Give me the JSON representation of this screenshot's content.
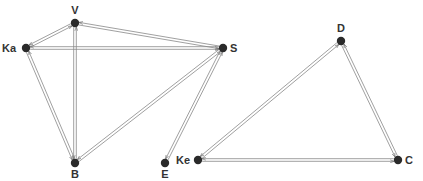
{
  "diagram": {
    "type": "directed-graph",
    "colors": {
      "node": "#2a2a2a",
      "edge": "#888888",
      "label": "#333333",
      "background": "#ffffff"
    },
    "nodes": [
      {
        "id": "V",
        "label": "V",
        "x": 75,
        "y": 23,
        "lx": 75,
        "ly": 14,
        "anchor": "middle"
      },
      {
        "id": "Ka",
        "label": "Ka",
        "x": 26,
        "y": 48,
        "lx": 16,
        "ly": 52,
        "anchor": "end"
      },
      {
        "id": "S",
        "label": "S",
        "x": 223,
        "y": 48,
        "lx": 230,
        "ly": 52,
        "anchor": "start"
      },
      {
        "id": "B",
        "label": "B",
        "x": 75,
        "y": 163,
        "lx": 75,
        "ly": 178,
        "anchor": "middle"
      },
      {
        "id": "E",
        "label": "E",
        "x": 165,
        "y": 163,
        "lx": 165,
        "ly": 178,
        "anchor": "middle"
      },
      {
        "id": "Ke",
        "label": "Ke",
        "x": 198,
        "y": 160,
        "lx": 190,
        "ly": 164,
        "anchor": "end"
      },
      {
        "id": "D",
        "label": "D",
        "x": 341,
        "y": 41,
        "lx": 341,
        "ly": 32,
        "anchor": "middle"
      },
      {
        "id": "C",
        "label": "C",
        "x": 398,
        "y": 160,
        "lx": 405,
        "ly": 164,
        "anchor": "start"
      }
    ],
    "edges": [
      {
        "from": "Ka",
        "to": "V",
        "bidirectional": true
      },
      {
        "from": "Ka",
        "to": "S",
        "bidirectional": true
      },
      {
        "from": "Ka",
        "to": "B",
        "bidirectional": true
      },
      {
        "from": "V",
        "to": "S",
        "bidirectional": true
      },
      {
        "from": "V",
        "to": "B",
        "bidirectional": true
      },
      {
        "from": "S",
        "to": "B",
        "bidirectional": true
      },
      {
        "from": "S",
        "to": "E",
        "bidirectional": true
      },
      {
        "from": "Ke",
        "to": "D",
        "bidirectional": true
      },
      {
        "from": "Ke",
        "to": "C",
        "bidirectional": true
      },
      {
        "from": "D",
        "to": "C",
        "bidirectional": true
      }
    ]
  }
}
